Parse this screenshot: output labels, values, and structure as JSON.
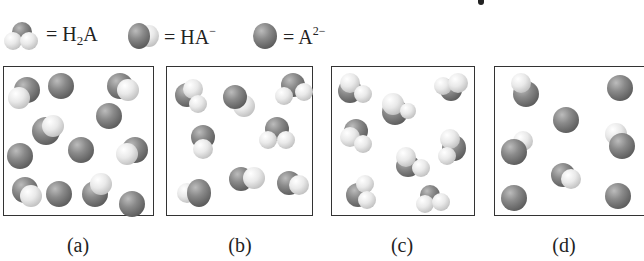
{
  "legend": [
    {
      "species": "H2A",
      "label_main": "H",
      "label_sub": "2",
      "label_after": "A",
      "label_sup": "",
      "icon": "h2a-molecule-icon"
    },
    {
      "species": "HA-",
      "label_main": "HA",
      "label_sub": "",
      "label_after": "",
      "label_sup": "−",
      "icon": "ha-minus-molecule-icon"
    },
    {
      "species": "A2-",
      "label_main": "A",
      "label_sub": "",
      "label_after": "",
      "label_sup": "2−",
      "icon": "a2-minus-ion-icon"
    }
  ],
  "equals": "=",
  "panels": [
    {
      "label": "(a)",
      "counts": {
        "H2A": 0,
        "HA-": 6,
        "A2-": 7
      }
    },
    {
      "label": "(b)",
      "counts": {
        "H2A": 2,
        "HA-": 6,
        "A2-": 0
      }
    },
    {
      "label": "(c)",
      "counts": {
        "H2A": 8,
        "HA-": 0,
        "A2-": 0
      }
    },
    {
      "label": "(d)",
      "counts": {
        "H2A": 0,
        "HA-": 3,
        "A2-": 5
      }
    }
  ],
  "colors": {
    "dark_atom": "#6e6e6e",
    "light_atom": "#e6e6e6",
    "border": "#333333"
  }
}
